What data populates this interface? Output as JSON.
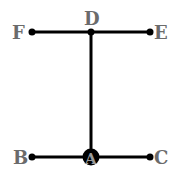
{
  "diagram": {
    "type": "line-segment-figure",
    "colors": {
      "line": "#000000",
      "label": "#6b6b6b",
      "point": "#000000",
      "inner_label": "#8a8a8a"
    },
    "points": {
      "F": {
        "label": "F",
        "x": 32,
        "y": 32
      },
      "D": {
        "label": "D",
        "x": 91,
        "y": 32
      },
      "E": {
        "label": "E",
        "x": 150,
        "y": 32
      },
      "B": {
        "label": "B",
        "x": 32,
        "y": 157
      },
      "A": {
        "label": "A",
        "x": 91,
        "y": 157
      },
      "C": {
        "label": "C",
        "x": 150,
        "y": 157
      }
    },
    "segments": [
      {
        "from": "F",
        "to": "E",
        "label": "FE"
      },
      {
        "from": "D",
        "to": "A",
        "label": "DA"
      },
      {
        "from": "B",
        "to": "C",
        "label": "BC"
      }
    ]
  }
}
